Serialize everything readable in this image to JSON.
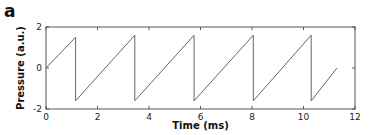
{
  "panel": {
    "label": "a"
  },
  "chart_data": {
    "type": "line",
    "title": "",
    "xlabel": "Time (ms)",
    "ylabel": "Pressure (a.u.)",
    "xlim": [
      0,
      12
    ],
    "ylim": [
      -2,
      2
    ],
    "xticks": [
      0,
      2,
      4,
      6,
      8,
      10,
      12
    ],
    "yticks": [
      -2,
      0,
      2
    ],
    "grid": false,
    "legend": null,
    "series": [
      {
        "name": "Pressure",
        "color": "#666666",
        "x": [
          0,
          1.15,
          1.15,
          3.45,
          3.45,
          5.75,
          5.75,
          8.05,
          8.05,
          10.3,
          10.3,
          11.3
        ],
        "y": [
          0,
          1.5,
          -1.6,
          1.6,
          -1.6,
          1.6,
          -1.6,
          1.6,
          -1.6,
          1.6,
          -1.6,
          -0.0
        ]
      }
    ]
  }
}
